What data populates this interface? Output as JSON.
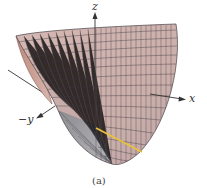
{
  "figure": {
    "caption": "(a)",
    "axes": {
      "z": "z",
      "x": "x",
      "neg_y": "−y"
    },
    "surface": {
      "type": "paraboloid-like surface mesh",
      "fill_color": "#c9aaa6",
      "inner_fill_color": "#b88f86",
      "shade_color": "#9a9a9e",
      "grid_color": "#3a3440",
      "highlight_curve_color": "#e8c23a"
    },
    "axis_color": "#333333"
  }
}
